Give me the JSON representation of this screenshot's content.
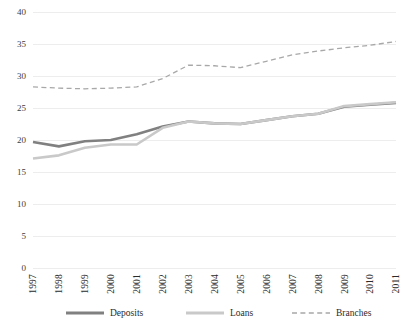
{
  "chart_data": {
    "type": "line",
    "title": "",
    "subtitle": "",
    "xlabel": "",
    "ylabel": "",
    "categories": [
      "1997",
      "1998",
      "1999",
      "2000",
      "2001",
      "2002",
      "2003",
      "2004",
      "2005",
      "2006",
      "2007",
      "2008",
      "2009",
      "2010",
      "2011"
    ],
    "ylim": [
      0,
      40
    ],
    "ytick_step": 5,
    "yticks": [
      "0",
      "5",
      "10",
      "15",
      "20",
      "25",
      "30",
      "35",
      "40"
    ],
    "grid": "horizontal",
    "legend_position": "bottom",
    "series": [
      {
        "name": "Deposits",
        "color": "#808080",
        "style": "solid",
        "width": 2.6,
        "values": [
          19.7,
          19.0,
          19.8,
          20.0,
          20.9,
          22.1,
          22.9,
          22.6,
          22.5,
          23.1,
          23.7,
          24.1,
          25.2,
          25.5,
          25.8
        ]
      },
      {
        "name": "Loans",
        "color": "#c9c9c9",
        "style": "solid",
        "width": 2.6,
        "values": [
          17.1,
          17.6,
          18.8,
          19.3,
          19.3,
          21.9,
          22.9,
          22.6,
          22.5,
          23.1,
          23.7,
          24.1,
          25.3,
          25.6,
          25.9
        ]
      },
      {
        "name": "Branches",
        "color": "#a8a8a8",
        "style": "dashed",
        "width": 1.3,
        "values": [
          28.3,
          28.1,
          28.0,
          28.1,
          28.3,
          29.6,
          31.7,
          31.6,
          31.3,
          32.3,
          33.3,
          33.9,
          34.4,
          34.8,
          35.4
        ]
      }
    ]
  },
  "legend": {
    "items": [
      {
        "label": "Deposits"
      },
      {
        "label": "Loans"
      },
      {
        "label": "Branches"
      }
    ]
  },
  "axis": {
    "y_tick_labels": [
      "40",
      "35",
      "30",
      "25",
      "20",
      "15",
      "10",
      "5",
      "0"
    ],
    "x_tick_labels": [
      "1997",
      "1998",
      "1999",
      "2000",
      "2001",
      "2002",
      "2003",
      "2004",
      "2005",
      "2006",
      "2007",
      "2008",
      "2009",
      "2010",
      "2011"
    ]
  }
}
